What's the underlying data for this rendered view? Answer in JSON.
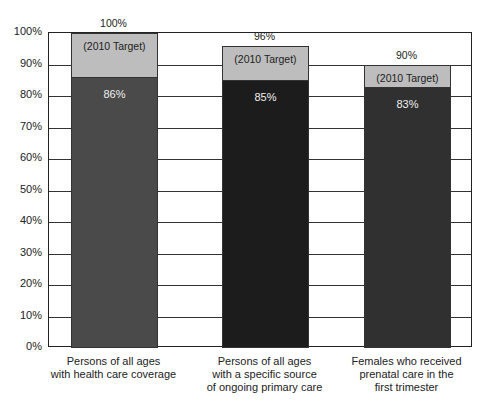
{
  "chart_data": {
    "type": "bar",
    "stacked": true,
    "title": "",
    "xlabel": "",
    "ylabel": "",
    "ylim": [
      0,
      100
    ],
    "yticks": [
      "0%",
      "10%",
      "20%",
      "30%",
      "40%",
      "50%",
      "60%",
      "70%",
      "80%",
      "90%",
      "100%"
    ],
    "grid": true,
    "categories": [
      "Persons of all ages\nwith health care coverage",
      "Persons of all ages\nwith a specific source\nof ongoing primary care",
      "Females who received\nprenatal care in the\nfirst trimester"
    ],
    "series": [
      {
        "name": "Current",
        "values": [
          86,
          85,
          83
        ],
        "labels": [
          "86%",
          "85%",
          "83%"
        ],
        "colors": [
          "#4a4a4a",
          "#1c1c1c",
          "#303030"
        ]
      },
      {
        "name": "2010 Target",
        "values": [
          100,
          96,
          90
        ],
        "labels": [
          "100%",
          "96%",
          "90%"
        ],
        "segment_label": "(2010 Target)",
        "color": "#bdbdbd"
      }
    ],
    "legend": "none"
  }
}
